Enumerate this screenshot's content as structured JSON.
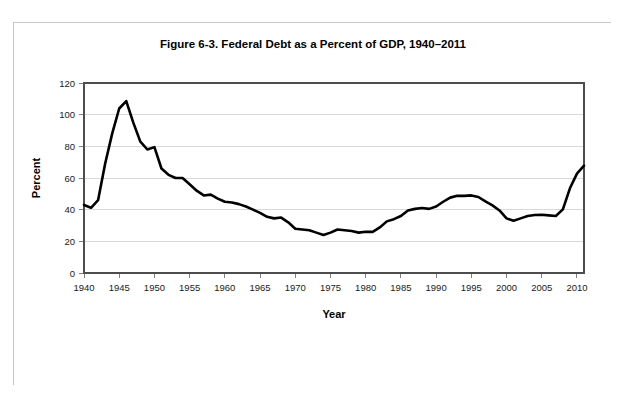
{
  "figure": {
    "title": "Figure 6-3. Federal Debt as a Percent of GDP, 1940–2011",
    "xlabel": "Year",
    "ylabel": "Percent"
  },
  "chart_data": {
    "type": "line",
    "title": "Figure 6-3. Federal Debt as a Percent of GDP, 1940–2011",
    "xlabel": "Year",
    "ylabel": "Percent",
    "xlim": [
      1940,
      2011
    ],
    "ylim": [
      0,
      120
    ],
    "grid": true,
    "legend": false,
    "line_color": "#000000",
    "xticks": [
      1940,
      1945,
      1950,
      1955,
      1960,
      1965,
      1970,
      1975,
      1980,
      1985,
      1990,
      1995,
      2000,
      2005,
      2010
    ],
    "yticks": [
      0,
      20,
      40,
      60,
      80,
      100,
      120
    ],
    "xtick_labels": [
      "1940",
      "1945",
      "1950",
      "1955",
      "1960",
      "1965",
      "1970",
      "1975",
      "1980",
      "1985",
      "1990",
      "1995",
      "2000",
      "2005",
      "2010"
    ],
    "ytick_labels": [
      "0",
      "20",
      "40",
      "60",
      "80",
      "100",
      "120"
    ],
    "series": [
      {
        "name": "Federal Debt as a Percent of GDP",
        "x": [
          1940,
          1941,
          1942,
          1943,
          1944,
          1945,
          1946,
          1947,
          1948,
          1949,
          1950,
          1951,
          1952,
          1953,
          1954,
          1955,
          1956,
          1957,
          1958,
          1959,
          1960,
          1961,
          1962,
          1963,
          1964,
          1965,
          1966,
          1967,
          1968,
          1969,
          1970,
          1971,
          1972,
          1973,
          1974,
          1975,
          1976,
          1977,
          1978,
          1979,
          1980,
          1981,
          1982,
          1983,
          1984,
          1985,
          1986,
          1987,
          1988,
          1989,
          1990,
          1991,
          1992,
          1993,
          1994,
          1995,
          1996,
          1997,
          1998,
          1999,
          2000,
          2001,
          2002,
          2003,
          2004,
          2005,
          2006,
          2007,
          2008,
          2009,
          2010,
          2011
        ],
        "y": [
          43.0,
          41.2,
          46.0,
          69.0,
          88.0,
          103.9,
          108.6,
          95.0,
          83.0,
          78.0,
          79.5,
          66.0,
          62.0,
          60.0,
          60.0,
          56.0,
          52.0,
          49.0,
          49.5,
          47.0,
          45.0,
          44.5,
          43.5,
          42.0,
          40.0,
          38.0,
          35.5,
          34.5,
          35.0,
          32.0,
          28.0,
          27.5,
          27.0,
          25.5,
          24.0,
          25.5,
          27.5,
          27.0,
          26.5,
          25.5,
          26.1,
          26.0,
          28.8,
          32.6,
          34.0,
          36.0,
          39.5,
          40.5,
          41.0,
          40.5,
          42.0,
          45.0,
          47.6,
          48.8,
          48.7,
          49.0,
          48.0,
          45.2,
          42.7,
          39.5,
          34.5,
          33.0,
          34.5,
          36.0,
          36.6,
          36.8,
          36.4,
          36.0,
          40.2,
          53.5,
          62.8,
          67.8
        ]
      }
    ]
  }
}
